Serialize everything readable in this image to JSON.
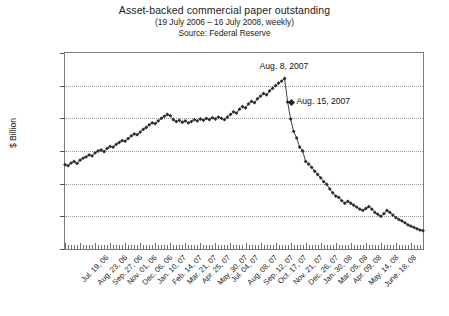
{
  "chart_data": {
    "type": "line",
    "title": "Asset-backed commercial paper outstanding",
    "subtitle": "(19 July 2006 – 16 July 2008, weekly)",
    "source": "Source:  Federal Reserve",
    "ylabel": "$ Billion",
    "xlabel": "",
    "ylim": [
      700,
      1300
    ],
    "yticks": [
      700,
      800,
      900,
      1000,
      1100,
      1200,
      1300
    ],
    "ytick_labels": [
      "700",
      "800",
      "900",
      "1,000",
      "1,100",
      "1,200",
      "1,300"
    ],
    "grid": "horizontal-dotted",
    "legend": "none",
    "marker": "filled-diamond",
    "line_color": "#2b2b2b",
    "xtick_labels": [
      "Jul. 19, 06",
      "Aug. 23, 06",
      "Sep. 27, 06",
      "Nov. 01, 06",
      "Dec. 06, 06",
      "Jan. 10, 07",
      "Feb. 14, 07",
      "Mar. 21, 07",
      "Apr. 25, 07",
      "May. 30, 07",
      "Jul. 04, 07",
      "Aug. 08, 07",
      "Sep. 12, 07",
      "Oct. 17, 07",
      "Nov. 21, 07",
      "Dec. 26, 07",
      "Jan. 30, 08",
      "Mar. 05, 08",
      "Apr. 09, 08",
      "May. 14, 08",
      "June. 18, 08"
    ],
    "xtick_label_interval": 5,
    "n_points": 105,
    "values": [
      958,
      955,
      963,
      968,
      962,
      972,
      978,
      982,
      988,
      985,
      994,
      1000,
      1003,
      998,
      1008,
      1014,
      1012,
      1020,
      1026,
      1032,
      1030,
      1038,
      1046,
      1052,
      1050,
      1058,
      1066,
      1072,
      1080,
      1086,
      1084,
      1092,
      1100,
      1106,
      1112,
      1108,
      1096,
      1090,
      1094,
      1088,
      1092,
      1086,
      1090,
      1096,
      1092,
      1098,
      1094,
      1100,
      1096,
      1102,
      1098,
      1104,
      1100,
      1096,
      1104,
      1112,
      1120,
      1116,
      1128,
      1136,
      1132,
      1144,
      1152,
      1148,
      1160,
      1168,
      1176,
      1172,
      1184,
      1192,
      1200,
      1208,
      1214,
      1222,
      1150,
      1098,
      1060,
      1040,
      1012,
      1000,
      968,
      960,
      950,
      938,
      928,
      918,
      906,
      898,
      884,
      872,
      862,
      858,
      848,
      840,
      846,
      840,
      834,
      828,
      822,
      818,
      824,
      830,
      822,
      812,
      806,
      800,
      808,
      818,
      812,
      804,
      796,
      790,
      786,
      780,
      774,
      770,
      766,
      762,
      758,
      756
    ],
    "annotations": [
      {
        "label": "Aug. 8, 2007",
        "value": 1222,
        "index": 73
      },
      {
        "label": "Aug. 15, 2007",
        "value": 1150,
        "index": 74
      }
    ]
  }
}
